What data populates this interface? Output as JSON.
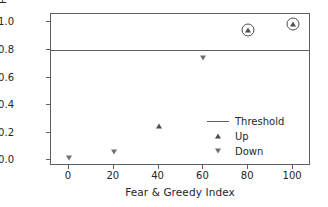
{
  "chart_data": {
    "type": "scatter",
    "title": "",
    "xlabel": "Fear & Greedy Index",
    "ylabel": "Probability of Going up",
    "xlim": [
      -8,
      108
    ],
    "ylim": [
      -0.04,
      1.06
    ],
    "xticks": [
      "0",
      "20",
      "40",
      "60",
      "80",
      "100"
    ],
    "xtick_values": [
      0,
      20,
      40,
      60,
      80,
      100
    ],
    "yticks": [
      "0.0",
      "0.2",
      "0.4",
      "0.6",
      "0.8",
      "1.0"
    ],
    "ytick_values": [
      0.0,
      0.2,
      0.4,
      0.6,
      0.8,
      1.0
    ],
    "grid": false,
    "legend_position": "center right",
    "threshold": {
      "label": "Threshold",
      "value": 0.8,
      "color": "#5f5f5f"
    },
    "series": [
      {
        "name": "Up",
        "marker": "triangle-up",
        "color": "#4d4d4d",
        "points": [
          {
            "x": 40,
            "y": 0.25,
            "highlighted": false
          },
          {
            "x": 80,
            "y": 0.945,
            "highlighted": true
          },
          {
            "x": 100,
            "y": 0.985,
            "highlighted": true
          }
        ]
      },
      {
        "name": "Down",
        "marker": "triangle-down",
        "color": "#6e6e6e",
        "points": [
          {
            "x": 0,
            "y": 0.02,
            "highlighted": false
          },
          {
            "x": 20,
            "y": 0.06,
            "highlighted": false
          },
          {
            "x": 60,
            "y": 0.74,
            "highlighted": false
          }
        ]
      }
    ],
    "legend_entries": [
      {
        "label": "Threshold",
        "key": "line"
      },
      {
        "label": "Up",
        "key": "triangle-up"
      },
      {
        "label": "Down",
        "key": "triangle-down"
      }
    ]
  }
}
